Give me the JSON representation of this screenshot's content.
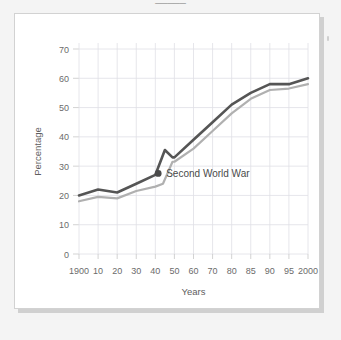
{
  "page": {
    "background_color": "#f4f4f4",
    "card_background_color": "#ffffff",
    "card_border_color": "#d2d2d2",
    "shadow_color": "#c9c9c9",
    "title_remnant": "_____"
  },
  "chart_data": {
    "type": "line",
    "title": "",
    "xlabel": "Years",
    "ylabel": "Percentage",
    "grid": true,
    "legend": "none",
    "xlim": [
      0,
      12
    ],
    "ylim": [
      0,
      70
    ],
    "yticks": [
      0,
      10,
      20,
      30,
      40,
      50,
      60,
      70
    ],
    "categories": [
      "1900",
      "10",
      "20",
      "30",
      "40",
      "50",
      "60",
      "70",
      "80",
      "85",
      "90",
      "95",
      "2000"
    ],
    "x": [
      0,
      1,
      2,
      3,
      4,
      5,
      6,
      7,
      8,
      9,
      10,
      11,
      12
    ],
    "series": [
      {
        "name": "upper-series",
        "color": "#555555",
        "values": [
          20,
          22,
          21,
          24,
          27,
          33,
          39,
          45,
          51,
          55,
          58,
          58,
          60
        ]
      },
      {
        "name": "lower-series",
        "color": "#b0b0b0",
        "values": [
          18,
          19.5,
          19,
          21.5,
          23,
          31.5,
          36,
          42,
          48,
          53,
          56,
          56.5,
          58
        ]
      }
    ],
    "extra_vertices": {
      "upper-series": [
        {
          "x": 4.5,
          "y": 35.5,
          "note": "wartime spike"
        },
        {
          "x": 4.9,
          "y": 33.0,
          "note": "post-spike dip"
        }
      ],
      "lower-series": [
        {
          "x": 4.4,
          "y": 24.0,
          "note": "wartime step"
        },
        {
          "x": 4.9,
          "y": 31.5,
          "note": "post-war rise"
        }
      ]
    },
    "annotations": [
      {
        "text": "Second World War",
        "marker": "dot",
        "marker_color": "#4a4a4a",
        "point_x": 4.15,
        "point_y": 27.5
      }
    ],
    "tick_label_color": "#6b6b6b",
    "axis_title_color": "#5e5e5e",
    "gridline_color": "#e0e0e6"
  }
}
